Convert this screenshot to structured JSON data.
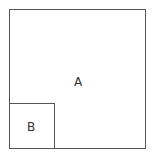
{
  "diagram": {
    "outer_square": {
      "label": "A"
    },
    "inner_square": {
      "label": "B"
    }
  }
}
